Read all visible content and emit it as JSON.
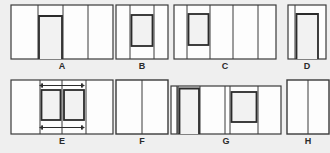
{
  "figure": {
    "background_color": "#efefef",
    "outline_color": "#3a3a3a",
    "thick_outline_color": "#2b2b2b",
    "panel_fill": "#fdfdfd",
    "inset_fill": "#f2f2f2",
    "label_color": "#2b2b2b",
    "rows": 2,
    "columns": 4,
    "panel_count": 8
  },
  "panels": [
    {
      "id": "A",
      "label": "A",
      "description": "Wide rectangle divided into four vertical bays; second bay contains a tall U-shaped opening open at the bottom",
      "bays": 4,
      "inset": "u-shape-open-bottom",
      "width": 102,
      "height": 54
    },
    {
      "id": "B",
      "label": "B",
      "description": "Rectangle divided into three vertical bays; center bay contains a closed rectangular inset",
      "bays": 3,
      "inset": "closed-rectangle",
      "width": 52,
      "height": 54
    },
    {
      "id": "C",
      "label": "C",
      "description": "Wide rectangle divided into five vertical bays; second bay contains a closed rectangular inset",
      "bays": 5,
      "inset": "closed-rectangle",
      "width": 102,
      "height": 54
    },
    {
      "id": "D",
      "label": "D",
      "description": "Narrow rectangle with a U-shaped opening open at the bottom",
      "bays": 2,
      "inset": "u-shape-open-bottom",
      "width": 38,
      "height": 54
    },
    {
      "id": "E",
      "label": "E",
      "description": "Wide rectangle with two rectangular insets side by side, with double-headed dimension arrows above and below the gap",
      "bays": 4,
      "inset": "double-rectangle-with-arrows",
      "annotations": [
        "double-headed-arrow-top",
        "double-headed-arrow-bottom"
      ],
      "width": 102,
      "height": 54
    },
    {
      "id": "F",
      "label": "F",
      "description": "Plain rectangle divided into two vertical bays",
      "bays": 2,
      "inset": "none",
      "width": 52,
      "height": 54
    },
    {
      "id": "G",
      "label": "G",
      "description": "Wide rectangle with narrow left bar, a U-shaped opening open at the bottom, and a closed rectangular inset near the right",
      "bays": 5,
      "inset": "u-shape-plus-closed-rectangle",
      "width": 110,
      "height": 54
    },
    {
      "id": "H",
      "label": "H",
      "description": "Plain rectangle divided into two vertical bays",
      "bays": 2,
      "inset": "none",
      "width": 42,
      "height": 54
    }
  ]
}
